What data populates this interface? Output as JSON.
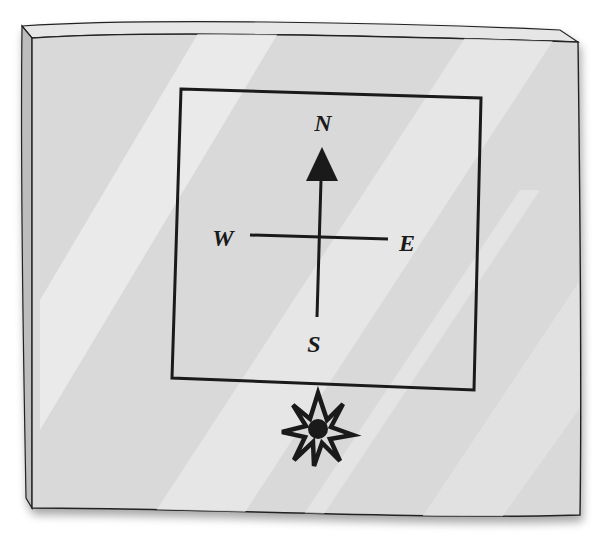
{
  "diagram": {
    "compass": {
      "north_label": "N",
      "south_label": "S",
      "east_label": "E",
      "west_label": "W",
      "arrow_direction": "north"
    },
    "light_source": {
      "icon": "eight-point-star-icon"
    }
  },
  "colors": {
    "panel_fill": "#d9d9d9",
    "panel_highlight": "#ececec",
    "ink": "#1a1a1a",
    "edge": "#b8b8b8"
  }
}
